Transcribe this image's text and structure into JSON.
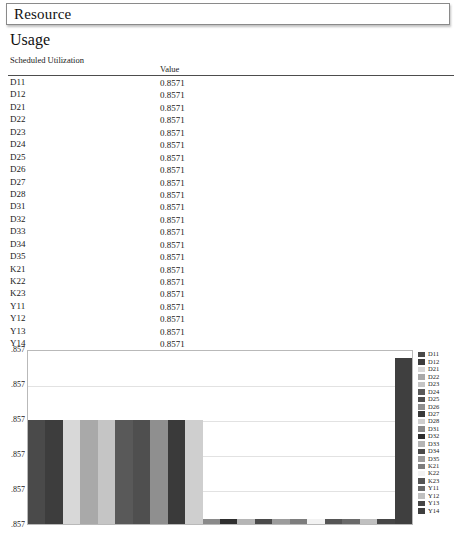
{
  "window": {
    "title": "Resource"
  },
  "section": {
    "heading": "Usage"
  },
  "table": {
    "columns": [
      "Scheduled Utilization",
      "Value"
    ],
    "rows": [
      {
        "label": "D11",
        "value": "0.8571"
      },
      {
        "label": "D12",
        "value": "0.8571"
      },
      {
        "label": "D21",
        "value": "0.8571"
      },
      {
        "label": "D22",
        "value": "0.8571"
      },
      {
        "label": "D23",
        "value": "0.8571"
      },
      {
        "label": "D24",
        "value": "0.8571"
      },
      {
        "label": "D25",
        "value": "0.8571"
      },
      {
        "label": "D26",
        "value": "0.8571"
      },
      {
        "label": "D27",
        "value": "0.8571"
      },
      {
        "label": "D28",
        "value": "0.8571"
      },
      {
        "label": "D31",
        "value": "0.8571"
      },
      {
        "label": "D32",
        "value": "0.8571"
      },
      {
        "label": "D33",
        "value": "0.8571"
      },
      {
        "label": "D34",
        "value": "0.8571"
      },
      {
        "label": "D35",
        "value": "0.8571"
      },
      {
        "label": "K21",
        "value": "0.8571"
      },
      {
        "label": "K22",
        "value": "0.8571"
      },
      {
        "label": "K23",
        "value": "0.8571"
      },
      {
        "label": "Y11",
        "value": "0.8571"
      },
      {
        "label": "Y12",
        "value": "0.8571"
      },
      {
        "label": "Y13",
        "value": "0.8571"
      },
      {
        "label": "Y14",
        "value": "0.8571"
      }
    ]
  },
  "chart_data": {
    "type": "bar",
    "title": "",
    "xlabel": "",
    "ylabel": "",
    "grid": true,
    "legend_position": "right",
    "ytick_labels": [
      ".857",
      ".857",
      ".857",
      ".857",
      ".857",
      ".857"
    ],
    "ylim": [
      0.857,
      0.857
    ],
    "categories": [
      "D11",
      "D12",
      "D21",
      "D22",
      "D23",
      "D24",
      "D25",
      "D26",
      "D27",
      "D28",
      "D31",
      "D32",
      "D33",
      "D34",
      "D35",
      "K21",
      "K22",
      "K23",
      "Y11",
      "Y12",
      "Y13",
      "Y14"
    ],
    "values": [
      0.8571,
      0.8571,
      0.8571,
      0.8571,
      0.8571,
      0.8571,
      0.8571,
      0.8571,
      0.8571,
      0.8571,
      0.8571,
      0.8571,
      0.8571,
      0.8571,
      0.8571,
      0.8571,
      0.8571,
      0.8571,
      0.8571,
      0.8571,
      0.8571,
      0.8571
    ],
    "bar_heights_pct": [
      60,
      60,
      60,
      60,
      60,
      60,
      60,
      60,
      60,
      60,
      3,
      3,
      3,
      3,
      3,
      3,
      3,
      3,
      3,
      3,
      3,
      96
    ],
    "bar_colors": [
      "#4a4a4a",
      "#3d3d3d",
      "#d8d8d8",
      "#a9a9a9",
      "#c5c5c5",
      "#595959",
      "#4f4f4f",
      "#8f8f8f",
      "#3a3a3a",
      "#cfcfcf",
      "#8a8a8a",
      "#2e2e2e",
      "#b5b5b5",
      "#4a4a4a",
      "#9c9c9c",
      "#7d7d7d",
      "#f2f2f2",
      "#555555",
      "#6a6a6a",
      "#c0c0c0",
      "#464646",
      "#3f3f3f"
    ],
    "legend": [
      {
        "label": "D11",
        "color": "#4a4a4a"
      },
      {
        "label": "D12",
        "color": "#3d3d3d"
      },
      {
        "label": "D21",
        "color": "#d8d8d8"
      },
      {
        "label": "D22",
        "color": "#a9a9a9"
      },
      {
        "label": "D23",
        "color": "#c5c5c5"
      },
      {
        "label": "D24",
        "color": "#595959"
      },
      {
        "label": "D25",
        "color": "#4f4f4f"
      },
      {
        "label": "D26",
        "color": "#8f8f8f"
      },
      {
        "label": "D27",
        "color": "#3a3a3a"
      },
      {
        "label": "D28",
        "color": "#cfcfcf"
      },
      {
        "label": "D31",
        "color": "#8a8a8a"
      },
      {
        "label": "D32",
        "color": "#2e2e2e"
      },
      {
        "label": "D33",
        "color": "#b5b5b5"
      },
      {
        "label": "D34",
        "color": "#4a4a4a"
      },
      {
        "label": "D35",
        "color": "#9c9c9c"
      },
      {
        "label": "K21",
        "color": "#7d7d7d"
      },
      {
        "label": "K22",
        "color": "#f2f2f2"
      },
      {
        "label": "K23",
        "color": "#555555"
      },
      {
        "label": "Y11",
        "color": "#6a6a6a"
      },
      {
        "label": "Y12",
        "color": "#c0c0c0"
      },
      {
        "label": "Y13",
        "color": "#464646"
      },
      {
        "label": "Y14",
        "color": "#3f3f3f"
      }
    ]
  }
}
